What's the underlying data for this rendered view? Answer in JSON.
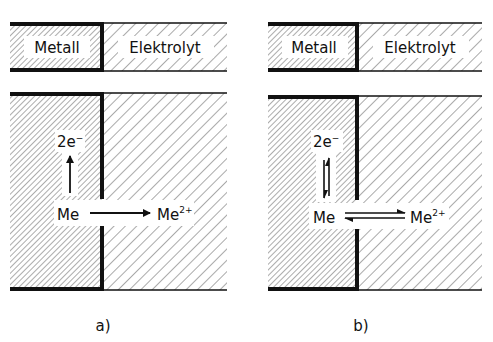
{
  "figure": {
    "panels": [
      {
        "id": "a",
        "caption": "a)",
        "header": {
          "left_label": "Metall",
          "right_label": "Elektrolyt"
        },
        "species": {
          "electrons": "2e",
          "electron_charge": "−",
          "metal": "Me",
          "ion": "Me",
          "ion_charge": "2+"
        },
        "reaction": "irreversible",
        "arrows": {
          "vertical": "up (Me → 2e⁻)",
          "horizontal": "right (Me → Me²⁺)"
        }
      },
      {
        "id": "b",
        "caption": "b)",
        "header": {
          "left_label": "Metall",
          "right_label": "Elektrolyt"
        },
        "species": {
          "electrons": "2e",
          "electron_charge": "−",
          "metal": "Me",
          "ion": "Me",
          "ion_charge": "2+"
        },
        "reaction": "equilibrium",
        "arrows": {
          "vertical": "equilibrium (⇅)",
          "horizontal": "equilibrium (⇌)"
        }
      }
    ],
    "colors": {
      "line": "#111111",
      "hatch": "#555555",
      "background": "#ffffff"
    }
  }
}
